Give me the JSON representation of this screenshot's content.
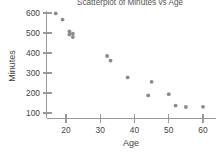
{
  "chart_data": {
    "type": "scatter",
    "title": "Scatterplot of Minutes vs Age",
    "xlabel": "Age",
    "ylabel": "Minutes",
    "xlim": [
      15,
      62
    ],
    "ylim": [
      90,
      625
    ],
    "xticks": [
      20,
      30,
      40,
      50,
      60
    ],
    "yticks": [
      100,
      200,
      300,
      400,
      500,
      600
    ],
    "xtick_labels": [
      "20",
      "30",
      "40",
      "50",
      "60"
    ],
    "ytick_labels": [
      "100",
      "200",
      "300",
      "400",
      "500",
      "600"
    ],
    "grid": false,
    "legend": "none",
    "marker": "filled-circle",
    "marker_color": "#8a8a8a",
    "series": [
      {
        "name": "Minutes vs Age",
        "points": [
          {
            "x": 17,
            "y": 598
          },
          {
            "x": 19,
            "y": 567
          },
          {
            "x": 21,
            "y": 508
          },
          {
            "x": 21,
            "y": 492
          },
          {
            "x": 22,
            "y": 497
          },
          {
            "x": 22,
            "y": 480
          },
          {
            "x": 32,
            "y": 385
          },
          {
            "x": 33,
            "y": 362
          },
          {
            "x": 38,
            "y": 278
          },
          {
            "x": 44,
            "y": 188
          },
          {
            "x": 45,
            "y": 256
          },
          {
            "x": 50,
            "y": 194
          },
          {
            "x": 52,
            "y": 137
          },
          {
            "x": 55,
            "y": 130
          },
          {
            "x": 60,
            "y": 131
          }
        ]
      }
    ]
  },
  "axes": {
    "title_clipped": true,
    "y_axis_name": "Minutes",
    "x_axis_name": "Age"
  }
}
